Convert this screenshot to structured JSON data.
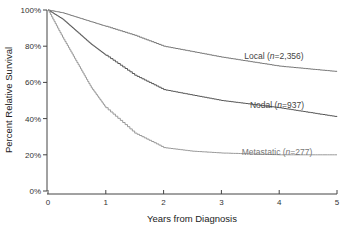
{
  "chart_data": {
    "type": "line",
    "title": "",
    "xlabel": "Years from Diagnosis",
    "ylabel": "Percent Relative Survival",
    "xlim": [
      0,
      5
    ],
    "ylim": [
      0,
      100
    ],
    "x_ticks": [
      "0",
      "1",
      "2",
      "3",
      "4",
      "5"
    ],
    "y_ticks": [
      "0%",
      "20%",
      "40%",
      "60%",
      "80%",
      "100%"
    ],
    "grid": false,
    "legend_position": "inline labels at right end of curves",
    "x": [
      0,
      0.25,
      0.5,
      0.75,
      1,
      1.5,
      2,
      2.5,
      3,
      3.5,
      4,
      4.5,
      5
    ],
    "series": [
      {
        "name": "Local",
        "label_text": "Local (n=2,356)",
        "label_prefix": "Local (",
        "label_n": "n",
        "label_suffix": "=2,356)",
        "color": "#777777",
        "values": [
          100,
          98.5,
          96,
          93.5,
          91,
          86,
          80,
          77,
          74,
          71.5,
          69,
          67.5,
          66
        ]
      },
      {
        "name": "Nodal",
        "label_text": "Nodal (n=937)",
        "label_prefix": "Nodal (",
        "label_n": "n",
        "label_suffix": "=937)",
        "color": "#555555",
        "values": [
          100,
          95,
          88,
          81,
          75,
          64,
          56,
          53,
          50,
          48,
          46,
          43.5,
          41
        ]
      },
      {
        "name": "Metastatic",
        "label_text": "Metastatic (n=277)",
        "label_prefix": "Metastatic (",
        "label_n": "n",
        "label_suffix": "=277)",
        "color": "#999999",
        "values": [
          100,
          85,
          71,
          57,
          46,
          32,
          24,
          22,
          21,
          20.5,
          20,
          20,
          20
        ]
      }
    ]
  }
}
